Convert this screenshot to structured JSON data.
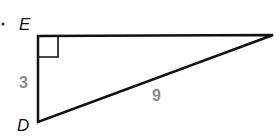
{
  "diagram": {
    "type": "right-triangle",
    "vertices": [
      {
        "name": "E",
        "label": "E"
      },
      {
        "name": "D",
        "label": "D"
      },
      {
        "name": "F",
        "label": ""
      }
    ],
    "sides": [
      {
        "between": "E-D",
        "length_label": "3"
      },
      {
        "between": "D-F",
        "length_label": "9"
      }
    ],
    "right_angle_at": "E",
    "colors": {
      "lines": "#111111",
      "measure_labels": "#8a8a8a"
    }
  }
}
